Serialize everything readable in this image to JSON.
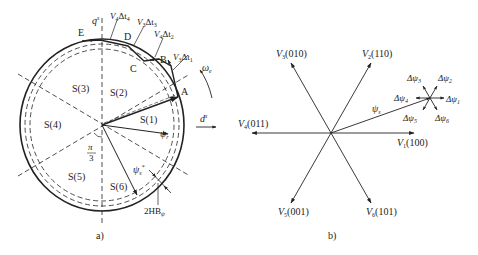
{
  "figure_a": {
    "caption": "a)",
    "axes": {
      "q": "q",
      "q_sup": "s",
      "d": "d",
      "d_sup": "s"
    },
    "sectors": [
      "S(1)",
      "S(2)",
      "S(3)",
      "S(4)",
      "S(5)",
      "S(6)"
    ],
    "points": [
      "A",
      "B",
      "C",
      "D",
      "E"
    ],
    "steps": [
      {
        "v": "V",
        "v_sub": "3",
        "dt": "Δt",
        "dt_sub": "1"
      },
      {
        "v": "V",
        "v_sub": "4",
        "dt": "Δt",
        "dt_sub": "2"
      },
      {
        "v": "V",
        "v_sub": "3",
        "dt": "Δt",
        "dt_sub": "3"
      },
      {
        "v": "V",
        "v_sub": "4",
        "dt": "Δt",
        "dt_sub": "4"
      }
    ],
    "omega": {
      "sym": "ω",
      "sub": "e"
    },
    "psi_r": {
      "sym": "ψ",
      "sub": "r"
    },
    "psi_s_ref": {
      "sym": "ψ",
      "sub": "s",
      "sup": "*"
    },
    "angle": {
      "num": "π",
      "den": "3"
    },
    "band": {
      "text": "2HB",
      "sub": "ψ"
    }
  },
  "figure_b": {
    "caption": "b)",
    "vectors": [
      {
        "name": "V",
        "sub": "1",
        "code": "(100)"
      },
      {
        "name": "V",
        "sub": "2",
        "code": "(110)"
      },
      {
        "name": "V",
        "sub": "3",
        "code": "(010)"
      },
      {
        "name": "V",
        "sub": "4",
        "code": "(011)"
      },
      {
        "name": "V",
        "sub": "5",
        "code": "(001)"
      },
      {
        "name": "V",
        "sub": "6",
        "code": "(101)"
      }
    ],
    "psi_s": {
      "sym": "ψ",
      "sub": "s"
    },
    "delta_psi": [
      {
        "sym": "Δψ",
        "sub": "1"
      },
      {
        "sym": "Δψ",
        "sub": "2"
      },
      {
        "sym": "Δψ",
        "sub": "3"
      },
      {
        "sym": "Δψ",
        "sub": "4"
      },
      {
        "sym": "Δψ",
        "sub": "5"
      },
      {
        "sym": "Δψ",
        "sub": "6"
      }
    ]
  },
  "colors": {
    "line": "#222222",
    "background": "#ffffff"
  }
}
